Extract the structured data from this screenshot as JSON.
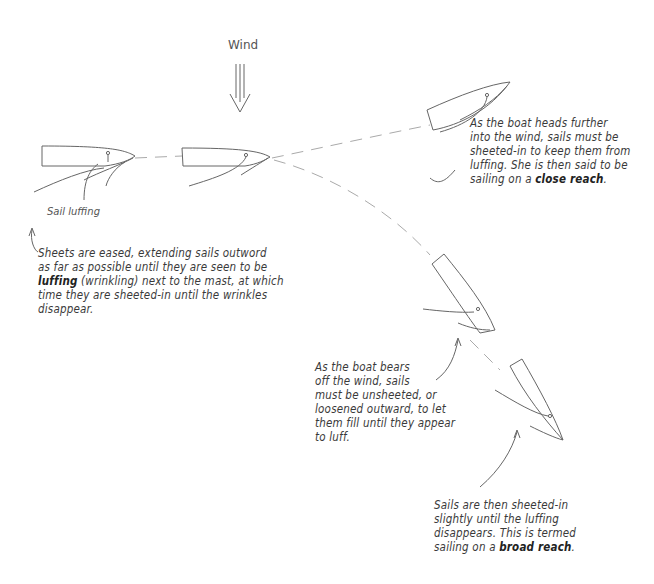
{
  "wind": {
    "label": "Wind",
    "icon": "triple-arrow-down-icon"
  },
  "labels": {
    "sail_luffing": "Sail luffing"
  },
  "notes": {
    "luffing": {
      "lines": [
        "Sheets are eased, extending sails outword",
        "as far as possible until they are seen to be"
      ],
      "line3_bold": "luffing",
      "line3_rest": " (wrinkling) next to the mast, at which",
      "lines_after": [
        "time they are sheeted-in until the wrinkles",
        "disappear."
      ]
    },
    "close_reach": {
      "lines": [
        "As the boat heads further",
        "into the wind, sails must be",
        "sheeted-in to keep them from",
        "luffing. She is then said to be"
      ],
      "last_prefix": "sailing on a ",
      "last_bold": "close reach",
      "last_suffix": "."
    },
    "bear_off": {
      "lines": [
        "As the boat bears",
        "off the wind, sails",
        "must be unsheeted, or",
        "loosened outward, to let",
        "them fill until they appear",
        "to luff."
      ]
    },
    "broad_reach": {
      "lines": [
        "Sails are then sheeted-in",
        "slightly until the luffing",
        "disappears. This is termed"
      ],
      "last_prefix": "sailing on a ",
      "last_bold": "broad reach",
      "last_suffix": "."
    }
  },
  "colors": {
    "ink": "#555555",
    "text": "#3a3a3a",
    "path": "#aaaaaa"
  }
}
